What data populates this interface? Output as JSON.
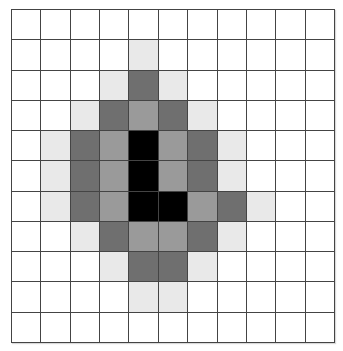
{
  "diagram": {
    "type": "pixel-grid",
    "rows": 11,
    "cols": 11,
    "palette": {
      "0": "#ffffff",
      "1": "#e9e9e9",
      "2": "#9a9a9a",
      "3": "#6f6f6f",
      "4": "#000000"
    },
    "levels": {
      "0": "white",
      "1": "light-gray",
      "2": "medium-gray",
      "3": "dark-gray",
      "4": "black"
    },
    "cells": [
      [
        0,
        0,
        0,
        0,
        0,
        0,
        0,
        0,
        0,
        0,
        0
      ],
      [
        0,
        0,
        0,
        0,
        1,
        0,
        0,
        0,
        0,
        0,
        0
      ],
      [
        0,
        0,
        0,
        1,
        3,
        1,
        0,
        0,
        0,
        0,
        0
      ],
      [
        0,
        0,
        1,
        3,
        2,
        3,
        1,
        0,
        0,
        0,
        0
      ],
      [
        0,
        1,
        3,
        2,
        4,
        2,
        3,
        1,
        0,
        0,
        0
      ],
      [
        0,
        1,
        3,
        2,
        4,
        2,
        3,
        1,
        0,
        0,
        0
      ],
      [
        0,
        1,
        3,
        2,
        4,
        4,
        2,
        3,
        1,
        0,
        0
      ],
      [
        0,
        0,
        1,
        3,
        2,
        2,
        3,
        1,
        0,
        0,
        0
      ],
      [
        0,
        0,
        0,
        1,
        3,
        3,
        1,
        0,
        0,
        0,
        0
      ],
      [
        0,
        0,
        0,
        0,
        1,
        1,
        0,
        0,
        0,
        0,
        0
      ],
      [
        0,
        0,
        0,
        0,
        0,
        0,
        0,
        0,
        0,
        0,
        0
      ]
    ]
  }
}
